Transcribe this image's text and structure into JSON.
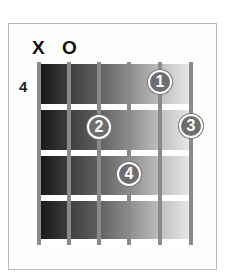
{
  "chord_diagram": {
    "top_markers": [
      {
        "string": 6,
        "label": "X"
      },
      {
        "string": 5,
        "label": "O"
      }
    ],
    "start_fret_label": "4",
    "strings": 6,
    "frets_shown": 4,
    "fingers": [
      {
        "label": "1",
        "string": 2,
        "fret": 1
      },
      {
        "label": "2",
        "string": 4,
        "fret": 2
      },
      {
        "label": "3",
        "string": 1,
        "fret": 2
      },
      {
        "label": "4",
        "string": 3,
        "fret": 3
      }
    ],
    "colors": {
      "gradient_dark": "#141414",
      "gradient_light": "#ececec",
      "dot_fill": "#6e6e6e",
      "string_color": "#8a8a8a",
      "fret_color": "#ffffff"
    }
  }
}
